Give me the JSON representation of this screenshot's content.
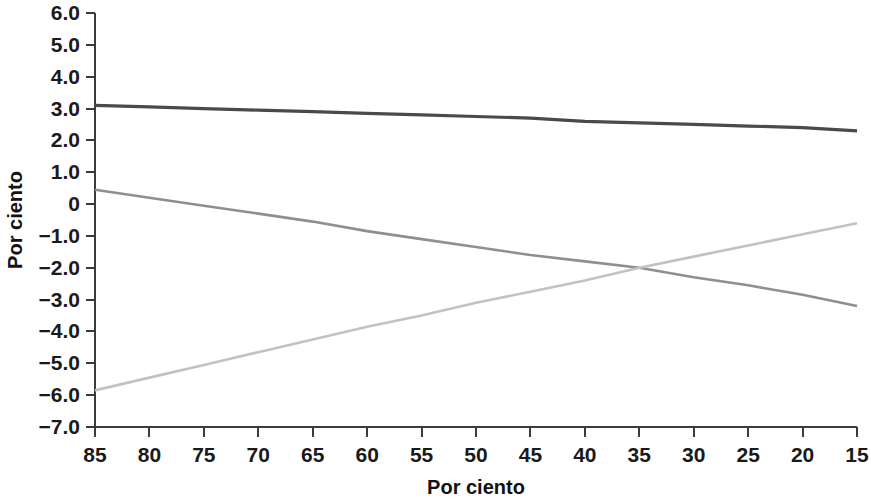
{
  "chart_data": {
    "type": "line",
    "title": "",
    "subtitle": "",
    "xlabel": "Por ciento",
    "ylabel": "Por ciento",
    "xlim": [
      85,
      15
    ],
    "ylim": [
      -7.0,
      6.0
    ],
    "x_reversed": true,
    "grid": false,
    "legend": "none",
    "x_ticks": [
      85,
      80,
      75,
      70,
      65,
      60,
      55,
      50,
      45,
      40,
      35,
      30,
      25,
      20,
      15
    ],
    "x_tick_labels": [
      "85",
      "80",
      "75",
      "70",
      "65",
      "60",
      "55",
      "50",
      "45",
      "40",
      "35",
      "30",
      "25",
      "20",
      "15"
    ],
    "y_ticks": [
      6.0,
      5.0,
      4.0,
      3.0,
      2.0,
      1.0,
      0,
      -1.0,
      -2.0,
      -3.0,
      -4.0,
      -5.0,
      -6.0,
      -7.0
    ],
    "y_tick_labels": [
      "6.0",
      "5.0",
      "4.0",
      "3.0",
      "2.0",
      "1.0",
      "0",
      "−1.0",
      "−2.0",
      "−3.0",
      "−4.0",
      "−5.0",
      "−6.0",
      "−7.0"
    ],
    "x": [
      85,
      80,
      75,
      70,
      65,
      60,
      55,
      50,
      45,
      40,
      35,
      30,
      25,
      20,
      15
    ],
    "series": [
      {
        "name": "dark-series",
        "color": "#4a4a4a",
        "width": 3.2,
        "values": [
          3.1,
          3.05,
          3.0,
          2.95,
          2.9,
          2.85,
          2.8,
          2.75,
          2.7,
          2.6,
          2.55,
          2.5,
          2.45,
          2.4,
          2.3
        ]
      },
      {
        "name": "medium-gray-series",
        "color": "#8f8f8f",
        "width": 2.6,
        "values": [
          0.45,
          0.2,
          -0.05,
          -0.3,
          -0.55,
          -0.85,
          -1.1,
          -1.35,
          -1.6,
          -1.8,
          -2.0,
          -2.3,
          -2.55,
          -2.85,
          -3.2
        ]
      },
      {
        "name": "light-gray-series",
        "color": "#c2c2c2",
        "width": 2.6,
        "values": [
          -5.85,
          -5.45,
          -5.05,
          -4.65,
          -4.25,
          -3.85,
          -3.5,
          -3.1,
          -2.75,
          -2.4,
          -2.0,
          -1.65,
          -1.3,
          -0.95,
          -0.6
        ]
      }
    ],
    "annotations": []
  }
}
